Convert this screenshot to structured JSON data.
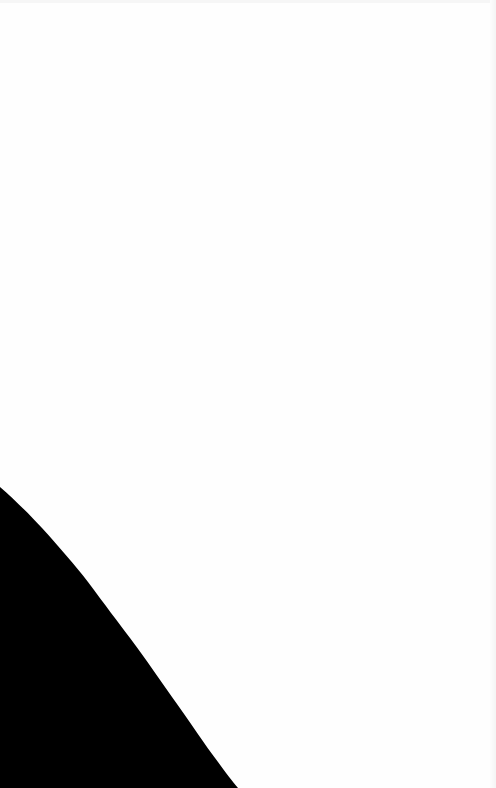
{
  "scene": {
    "description": "Blank white surface with a dark curved shape in the lower-left corner",
    "background_color": "#fefefe",
    "shape_color": "#000000",
    "text": ""
  }
}
